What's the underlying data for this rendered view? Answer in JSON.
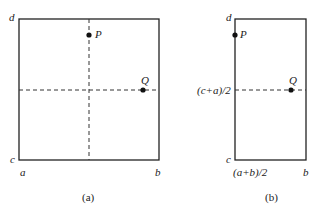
{
  "panel_a": {
    "caption": "(a)",
    "corner_labels": {
      "d": "d",
      "c": "c",
      "a": "a",
      "b": "b"
    },
    "points": [
      {
        "name": "P",
        "label": "P"
      },
      {
        "name": "Q",
        "label": "Q"
      }
    ]
  },
  "panel_b": {
    "caption": "(b)",
    "corner_labels": {
      "d": "d",
      "c": "c",
      "x_mid": "(a+b)/2",
      "b": "b"
    },
    "y_mid_label": "(c+a)/2",
    "points": [
      {
        "name": "P",
        "label": "P"
      },
      {
        "name": "Q",
        "label": "Q"
      }
    ]
  },
  "colors": {
    "line": "#222222",
    "background": "#ffffff"
  }
}
